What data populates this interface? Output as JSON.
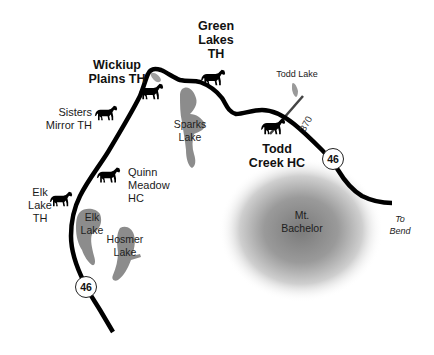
{
  "map": {
    "colors": {
      "road": "#000000",
      "lake": "#8c8c8c",
      "mountain_center": "#7a7a7a",
      "background": "#ffffff"
    },
    "trailheads": [
      {
        "id": "wickiup",
        "label_line1": "Wickiup",
        "label_line2": "Plains TH",
        "icon": "horse-icon"
      },
      {
        "id": "green-lakes",
        "label_line1": "Green",
        "label_line2": "Lakes",
        "label_line3": "TH",
        "icon": "horse-icon"
      },
      {
        "id": "sisters-mirror",
        "label_line1": "Sisters",
        "label_line2": "Mirror TH",
        "icon": "horse-icon"
      },
      {
        "id": "quinn-meadow",
        "label_line1": "Quinn",
        "label_line2": "Meadow",
        "label_line3": "HC",
        "icon": "horse-icon"
      },
      {
        "id": "elk-lake",
        "label_line1": "Elk",
        "label_line2": "Lake",
        "label_line3": "TH",
        "icon": "horse-icon"
      },
      {
        "id": "todd-creek",
        "label_line1": "Todd",
        "label_line2": "Creek HC",
        "icon": "horse-icon"
      }
    ],
    "lakes": [
      {
        "id": "sparks",
        "line1": "Sparks",
        "line2": "Lake"
      },
      {
        "id": "elk",
        "line1": "Elk",
        "line2": "Lake"
      },
      {
        "id": "hosmer",
        "line1": "Hosmer",
        "line2": "Lake"
      },
      {
        "id": "todd",
        "label": "Todd Lake"
      }
    ],
    "mountain": {
      "line1": "Mt.",
      "line2": "Bachelor"
    },
    "roads": {
      "highway_number": "46",
      "spur_number": "370",
      "destination_line1": "To",
      "destination_line2": "Bend"
    }
  }
}
